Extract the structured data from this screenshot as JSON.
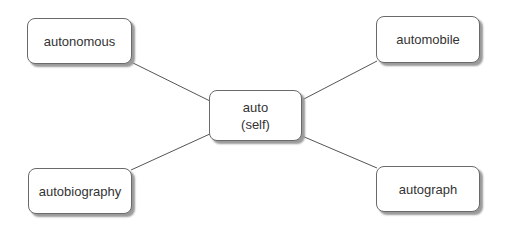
{
  "diagram": {
    "type": "word-web",
    "center": {
      "line1": "auto",
      "line2": "(self)"
    },
    "nodes": [
      {
        "id": "autonomous",
        "label": "autonomous"
      },
      {
        "id": "automobile",
        "label": "automobile"
      },
      {
        "id": "autobiography",
        "label": "autobiography"
      },
      {
        "id": "autograph",
        "label": "autograph"
      }
    ],
    "line_color": "#555555",
    "border_color": "#6a6a6a"
  }
}
